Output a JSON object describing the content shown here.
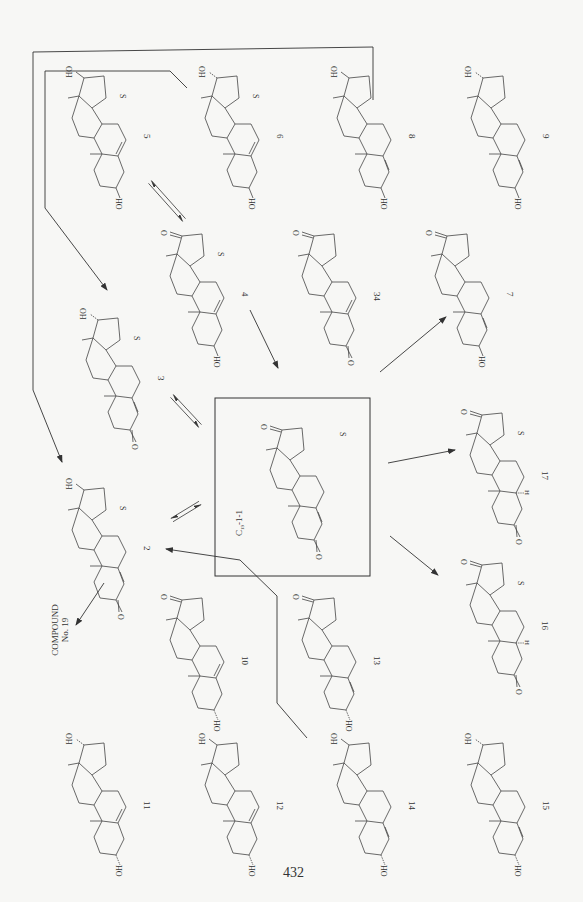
{
  "page": {
    "number": "432",
    "background": "#f7f7f5",
    "ink": "#333333"
  },
  "central_box": {
    "label": "C19-1-1",
    "label_main": "C",
    "label_sub": "19",
    "label_rest": "-1-1",
    "s_mark": "S"
  },
  "compound19": {
    "line1": "COMPOUND",
    "line2": "No. 19"
  },
  "compounds": [
    {
      "id": "5",
      "x": 62,
      "y": 68,
      "c17": "OH",
      "c17_stereo": "beta",
      "c3": "HO",
      "c3_stereo": "beta",
      "ring_b_double": "5,6",
      "c17_ketone": false,
      "c3_ketone": false,
      "s_mark": "S",
      "h5": ""
    },
    {
      "id": "6",
      "x": 195,
      "y": 68,
      "c17": "OH",
      "c17_stereo": "alpha",
      "c3": "HO",
      "c3_stereo": "beta",
      "ring_b_double": "5,6",
      "c17_ketone": false,
      "c3_ketone": false,
      "s_mark": "S",
      "h5": ""
    },
    {
      "id": "8",
      "x": 327,
      "y": 68,
      "c17": "OH",
      "c17_stereo": "beta",
      "c3": "HO",
      "c3_stereo": "beta",
      "ring_b_double": "4,5",
      "c17_ketone": false,
      "c3_ketone": false,
      "s_mark": "",
      "h5": ""
    },
    {
      "id": "9",
      "x": 461,
      "y": 68,
      "c17": "OH",
      "c17_stereo": "alpha",
      "c3": "HO",
      "c3_stereo": "beta",
      "ring_b_double": "4,5",
      "c17_ketone": false,
      "c3_ketone": false,
      "s_mark": "",
      "h5": ""
    },
    {
      "id": "4",
      "x": 160,
      "y": 226,
      "c17": "O",
      "c17_stereo": "",
      "c3": "HO",
      "c3_stereo": "beta",
      "ring_b_double": "5,6",
      "c17_ketone": true,
      "c3_ketone": false,
      "s_mark": "S",
      "h5": ""
    },
    {
      "id": "34",
      "x": 292,
      "y": 226,
      "c17": "O",
      "c17_stereo": "",
      "c3": "O",
      "c3_stereo": "",
      "ring_b_double": "5,6",
      "c17_ketone": true,
      "c3_ketone": true,
      "s_mark": "",
      "h5": ""
    },
    {
      "id": "7",
      "x": 425,
      "y": 226,
      "c17": "O",
      "c17_stereo": "",
      "c3": "HO",
      "c3_stereo": "beta",
      "ring_b_double": "4,5",
      "c17_ketone": true,
      "c3_ketone": false,
      "s_mark": "",
      "h5": ""
    },
    {
      "id": "3",
      "x": 76,
      "y": 310,
      "c17": "OH",
      "c17_stereo": "alpha",
      "c3": "O",
      "c3_stereo": "",
      "ring_b_double": "4,5",
      "c17_ketone": false,
      "c3_ketone": true,
      "s_mark": "S",
      "h5": ""
    },
    {
      "id": "17",
      "x": 460,
      "y": 405,
      "c17": "O",
      "c17_stereo": "",
      "c3": "O",
      "c3_stereo": "",
      "ring_b_double": "",
      "c17_ketone": true,
      "c3_ketone": true,
      "s_mark": "S",
      "h5": "H"
    },
    {
      "id": "2",
      "x": 62,
      "y": 480,
      "c17": "OH",
      "c17_stereo": "beta",
      "c3": "O",
      "c3_stereo": "",
      "ring_b_double": "4,5",
      "c17_ketone": false,
      "c3_ketone": true,
      "s_mark": "S",
      "h5": ""
    },
    {
      "id": "16",
      "x": 460,
      "y": 555,
      "c17": "O",
      "c17_stereo": "",
      "c3": "O",
      "c3_stereo": "",
      "ring_b_double": "",
      "c17_ketone": true,
      "c3_ketone": true,
      "s_mark": "S",
      "h5": "H"
    },
    {
      "id": "10",
      "x": 160,
      "y": 590,
      "c17": "O",
      "c17_stereo": "",
      "c3": "HO",
      "c3_stereo": "alpha",
      "ring_b_double": "5,6",
      "c17_ketone": true,
      "c3_ketone": false,
      "s_mark": "",
      "h5": ""
    },
    {
      "id": "13",
      "x": 292,
      "y": 590,
      "c17": "O",
      "c17_stereo": "",
      "c3": "HO",
      "c3_stereo": "alpha",
      "ring_b_double": "4,5",
      "c17_ketone": true,
      "c3_ketone": false,
      "s_mark": "",
      "h5": ""
    },
    {
      "id": "11",
      "x": 62,
      "y": 735,
      "c17": "OH",
      "c17_stereo": "alpha",
      "c3": "HO",
      "c3_stereo": "alpha",
      "ring_b_double": "5,6",
      "c17_ketone": false,
      "c3_ketone": false,
      "s_mark": "",
      "h5": ""
    },
    {
      "id": "12",
      "x": 195,
      "y": 735,
      "c17": "OH",
      "c17_stereo": "beta",
      "c3": "HO",
      "c3_stereo": "alpha",
      "ring_b_double": "5,6",
      "c17_ketone": false,
      "c3_ketone": false,
      "s_mark": "",
      "h5": ""
    },
    {
      "id": "14",
      "x": 327,
      "y": 735,
      "c17": "OH",
      "c17_stereo": "beta",
      "c3": "HO",
      "c3_stereo": "alpha",
      "ring_b_double": "4,5",
      "c17_ketone": false,
      "c3_ketone": false,
      "s_mark": "",
      "h5": ""
    },
    {
      "id": "15",
      "x": 461,
      "y": 735,
      "c17": "OH",
      "c17_stereo": "alpha",
      "c3": "HO",
      "c3_stereo": "alpha",
      "ring_b_double": "4,5",
      "c17_ketone": false,
      "c3_ketone": false,
      "s_mark": "",
      "h5": ""
    }
  ],
  "central_compound": {
    "x": 260,
    "y": 420,
    "c17": "O",
    "c3": "O",
    "ring_b_double": "4,5",
    "c17_ketone": true,
    "c3_ketone": true
  },
  "arrows": [
    {
      "name": "arrow-5-6-equilibrium",
      "type": "equilibrium",
      "from": [
        150,
        182
      ],
      "to": [
        184,
        220
      ]
    },
    {
      "name": "arrow-3-central-equilibrium",
      "type": "equilibrium",
      "from": [
        172,
        396
      ],
      "to": [
        200,
        426
      ]
    },
    {
      "name": "arrow-central-2-equilibrium",
      "type": "equilibrium",
      "from": [
        200,
        503
      ],
      "to": [
        172,
        520
      ]
    },
    {
      "name": "arrow-4-central",
      "type": "single",
      "from": [
        250,
        310
      ],
      "to": [
        278,
        368
      ]
    },
    {
      "name": "arrow-central-7",
      "type": "single",
      "from": [
        380,
        372
      ],
      "to": [
        446,
        317
      ]
    },
    {
      "name": "arrow-central-17",
      "type": "single",
      "from": [
        388,
        463
      ],
      "to": [
        455,
        450
      ]
    },
    {
      "name": "arrow-central-16",
      "type": "single",
      "from": [
        390,
        536
      ],
      "to": [
        438,
        575
      ]
    },
    {
      "name": "arrow-2-compound19",
      "type": "single",
      "from": [
        104,
        583
      ],
      "to": [
        76,
        625
      ]
    },
    {
      "name": "arrow-14-2",
      "type": "path",
      "points": [
        [
          307,
          738
        ],
        [
          277,
          703
        ],
        [
          277,
          596
        ],
        [
          240,
          560
        ],
        [
          166,
          549
        ]
      ]
    },
    {
      "name": "arrow-6-3",
      "type": "path",
      "points": [
        [
          187,
          88
        ],
        [
          170,
          71
        ],
        [
          45,
          71
        ],
        [
          45,
          208
        ],
        [
          107,
          290
        ]
      ]
    },
    {
      "name": "arrow-8-2",
      "type": "path",
      "points": [
        [
          373,
          100
        ],
        [
          373,
          47
        ],
        [
          33,
          52
        ],
        [
          33,
          390
        ],
        [
          62,
          462
        ]
      ]
    }
  ]
}
